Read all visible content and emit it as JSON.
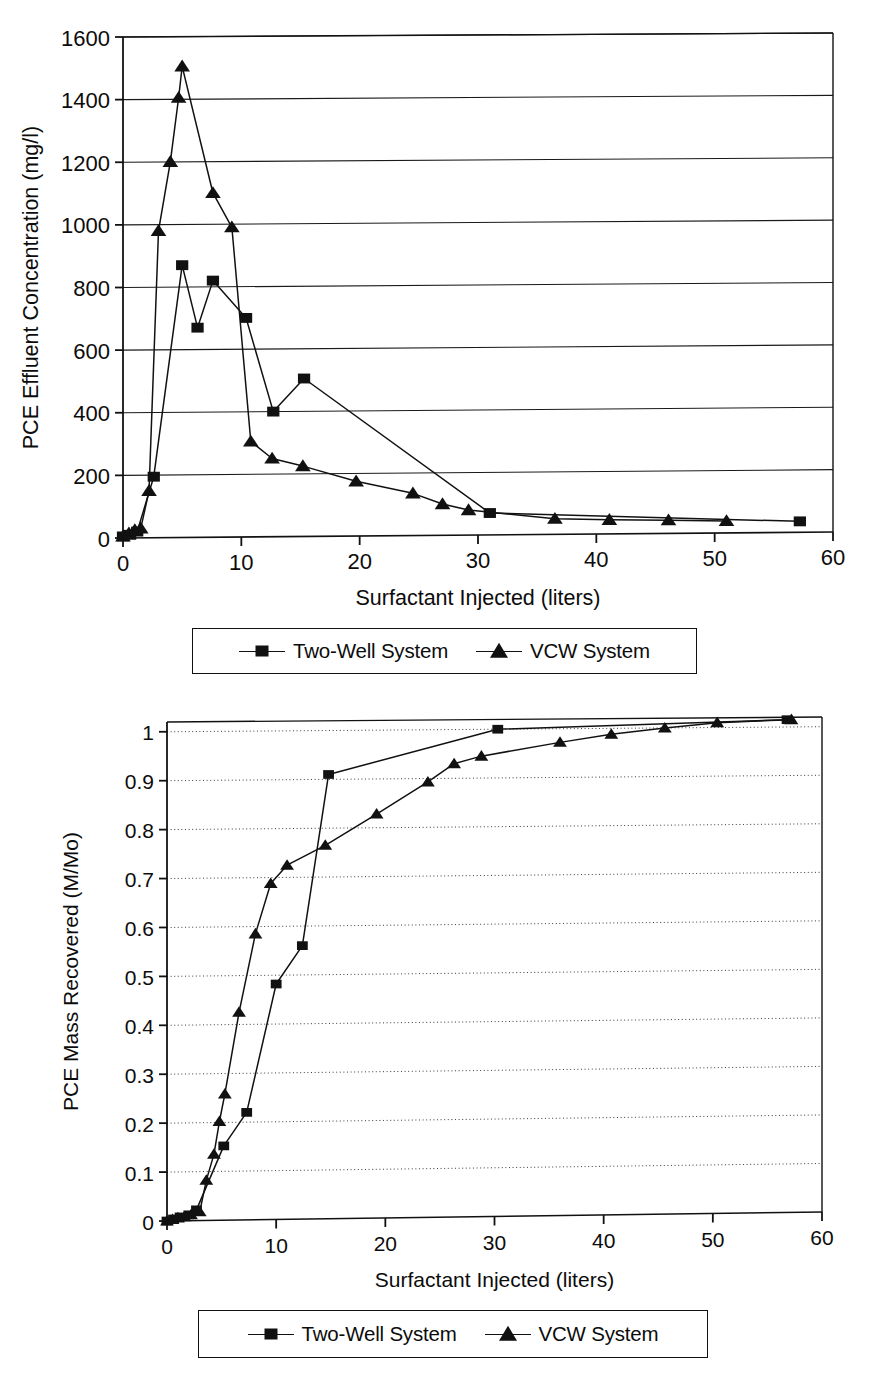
{
  "figures": [
    {
      "id": "pce-effluent-concentration",
      "legend": {
        "entries": [
          {
            "label": "Two-Well System",
            "marker": "square-marker-icon"
          },
          {
            "label": "VCW System",
            "marker": "triangle-marker-icon"
          }
        ]
      }
    },
    {
      "id": "pce-mass-recovered",
      "legend": {
        "entries": [
          {
            "label": "Two-Well System",
            "marker": "square-marker-icon"
          },
          {
            "label": "VCW System",
            "marker": "triangle-marker-icon"
          }
        ]
      }
    }
  ],
  "chart_data": [
    {
      "type": "line",
      "title": "",
      "xlabel": "Surfactant Injected (liters)",
      "ylabel": "PCE Effluent Concentration (mg/l)",
      "xlim": [
        0,
        60
      ],
      "ylim": [
        0,
        1600
      ],
      "xticks": [
        0,
        10,
        20,
        30,
        40,
        50,
        60
      ],
      "yticks": [
        0,
        200,
        400,
        600,
        800,
        1000,
        1200,
        1400,
        1600
      ],
      "xticklabels": [
        "0",
        "10",
        "20",
        "30",
        "40",
        "50",
        "60"
      ],
      "yticklabels": [
        "0",
        "200",
        "400",
        "600",
        "800",
        "1000",
        "1200",
        "1400",
        "1600"
      ],
      "grid": "horizontal-solid",
      "legend_position": "below",
      "series": [
        {
          "name": "Two-Well System",
          "marker": "square",
          "x": [
            0.0,
            0.6,
            1.2,
            2.6,
            5.0,
            6.3,
            7.6,
            10.4,
            12.7,
            15.3,
            31.0,
            57.2
          ],
          "y": [
            5,
            10,
            20,
            195,
            870,
            670,
            820,
            700,
            400,
            505,
            70,
            35
          ]
        },
        {
          "name": "VCW System",
          "marker": "triangle",
          "x": [
            0.0,
            0.5,
            1.0,
            1.5,
            2.2,
            3.0,
            4.0,
            4.7,
            5.0,
            7.6,
            9.2,
            10.8,
            12.6,
            15.2,
            19.7,
            24.5,
            27.0,
            29.2,
            36.5,
            41.1,
            46.1,
            51.0
          ],
          "y": [
            5,
            15,
            25,
            30,
            150,
            980,
            1200,
            1405,
            1505,
            1100,
            990,
            305,
            250,
            225,
            175,
            135,
            100,
            80,
            50,
            45,
            42,
            38
          ]
        }
      ]
    },
    {
      "type": "line",
      "title": "",
      "xlabel": "Surfactant Injected (liters)",
      "ylabel": "PCE Mass Recovered (M/Mo)",
      "xlim": [
        0,
        60
      ],
      "ylim": [
        0,
        1.02
      ],
      "xticks": [
        0,
        10,
        20,
        30,
        40,
        50,
        60
      ],
      "yticks": [
        0,
        0.1,
        0.2,
        0.3,
        0.4,
        0.5,
        0.6,
        0.7,
        0.8,
        0.9,
        1
      ],
      "xticklabels": [
        "0",
        "10",
        "20",
        "30",
        "40",
        "50",
        "60"
      ],
      "yticklabels": [
        "0",
        "0.1",
        "0.2",
        "0.3",
        "0.4",
        "0.5",
        "0.6",
        "0.7",
        "0.8",
        "0.9",
        "1"
      ],
      "grid": "horizontal-dotted",
      "legend_position": "below",
      "series": [
        {
          "name": "Two-Well System",
          "marker": "square",
          "x": [
            0.0,
            0.6,
            1.2,
            2.0,
            2.7,
            5.2,
            7.3,
            10.0,
            12.4,
            14.8,
            30.3,
            56.8
          ],
          "y": [
            0.0,
            0.004,
            0.008,
            0.012,
            0.022,
            0.152,
            0.22,
            0.482,
            0.56,
            0.91,
            1.0,
            1.015
          ]
        },
        {
          "name": "VCW System",
          "marker": "triangle",
          "x": [
            0.0,
            0.5,
            1.0,
            1.6,
            2.2,
            3.0,
            3.6,
            4.3,
            4.8,
            5.3,
            6.6,
            8.1,
            9.5,
            11.0,
            14.5,
            19.2,
            23.9,
            26.3,
            28.8,
            36.0,
            40.7,
            45.6,
            50.4,
            57.2
          ],
          "y": [
            0.0,
            0.003,
            0.006,
            0.008,
            0.012,
            0.018,
            0.082,
            0.135,
            0.202,
            0.258,
            0.425,
            0.585,
            0.688,
            0.725,
            0.765,
            0.828,
            0.893,
            0.93,
            0.945,
            0.972,
            0.988,
            1.0,
            1.01,
            1.015
          ]
        }
      ]
    }
  ]
}
